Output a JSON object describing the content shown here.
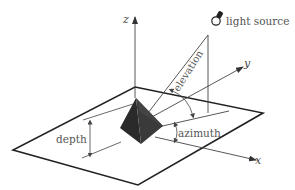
{
  "diagram": {
    "title": "",
    "colors": {
      "line": "#222222",
      "thin": "#444444",
      "pyramid": "#2b2b2b",
      "text": "#555555",
      "background": "#ffffff"
    },
    "axes": {
      "x": "x",
      "y": "y",
      "z": "z"
    },
    "labels": {
      "light_source": "light source",
      "elevation": "elevation",
      "azimuth": "azimuth",
      "depth": "depth"
    },
    "icons": {
      "light_source": "light-bulb-icon"
    }
  }
}
